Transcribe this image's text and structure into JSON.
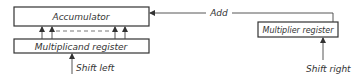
{
  "diagram": {
    "accumulator": {
      "label": "Accumulator"
    },
    "multiplicand": {
      "label": "Multiplicand register"
    },
    "multiplier": {
      "label": "Multiplier register"
    },
    "add_label": "Add",
    "shift_left_label": "Shift left",
    "shift_right_label": "Shift right"
  }
}
